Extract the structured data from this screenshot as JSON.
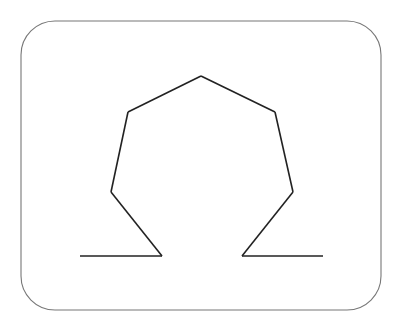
{
  "figure": {
    "symbol": "Ω",
    "colors": {
      "background": "#ffffff",
      "frame": "#777777",
      "shape": "#222222"
    },
    "segments": [
      "left-base",
      "left-leg",
      "left-side-lower",
      "left-shoulder",
      "right-shoulder",
      "right-side-lower",
      "right-leg",
      "right-base"
    ]
  }
}
